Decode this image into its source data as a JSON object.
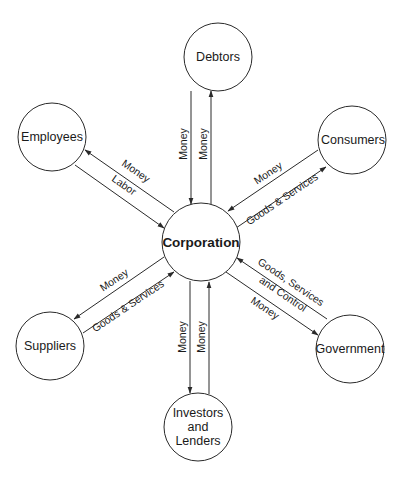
{
  "diagram": {
    "title": "",
    "center": {
      "label": "Corporation"
    },
    "nodes": {
      "debtors": "Debtors",
      "employees": "Employees",
      "consumers": "Consumers",
      "suppliers": "Suppliers",
      "government": "Government",
      "investors_line1": "Investors",
      "investors_line2": "and",
      "investors_line3": "Lenders"
    },
    "edges": {
      "debtors_out": "Money",
      "debtors_in": "Money",
      "employees_out": "Money",
      "employees_in": "Labor",
      "consumers_in": "Money",
      "consumers_out": "Goods & Services",
      "suppliers_out": "Money",
      "suppliers_in": "Goods & Services",
      "government_in_line1": "Goods, Services",
      "government_in_line2": "and Control",
      "government_out": "Money",
      "investors_out": "Money",
      "investors_in": "Money"
    },
    "colors": {
      "stroke": "#2a2a2a",
      "background": "#ffffff"
    }
  }
}
